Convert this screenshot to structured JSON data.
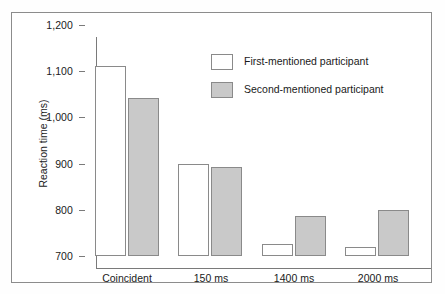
{
  "chart_data": {
    "type": "bar",
    "title": "",
    "xlabel": "",
    "ylabel": "Reaction time (ms)",
    "categories": [
      "Coincident",
      "150 ms",
      "1400 ms",
      "2000 ms"
    ],
    "series": [
      {
        "name": "First-mentioned participant",
        "values": [
          1112,
          899,
          726,
          720
        ],
        "color": "#ffffff"
      },
      {
        "name": "Second-mentioned participant",
        "values": [
          1042,
          893,
          787,
          800
        ],
        "color": "#c9c9c9"
      }
    ],
    "ylim": [
      700,
      1200
    ],
    "yticks": [
      700,
      800,
      900,
      1000,
      1100,
      1200
    ],
    "ytick_labels": [
      "700",
      "800",
      "900",
      "1,000",
      "1,100",
      "1,200"
    ],
    "grid": false,
    "legend_position": "top-center"
  },
  "legend": {
    "entries": [
      {
        "label": "First-mentioned participant",
        "swatch": "first"
      },
      {
        "label": "Second-mentioned participant",
        "swatch": "second"
      }
    ]
  },
  "axis": {
    "y_title": "Reaction time (ms)"
  }
}
